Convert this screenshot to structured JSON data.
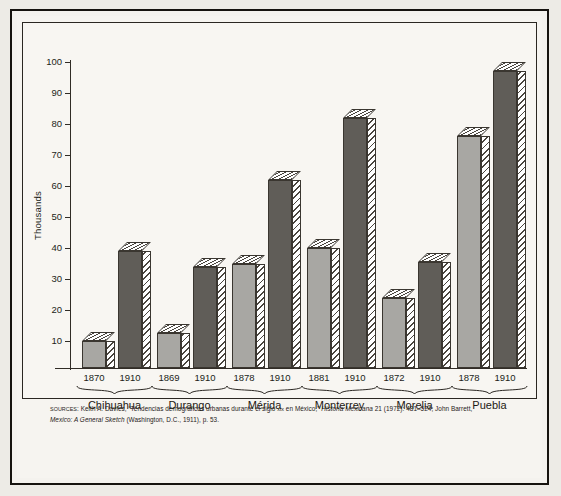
{
  "figure": {
    "y_axis_title": "Thousands",
    "source_note": {
      "prefix": "SOURCES",
      "separator": ": ",
      "part1": "Keith A. Davies, “Tendencias demográficas urbanas durante el siglo ",
      "centuryRoman": "xix",
      "part2": " en México,” ",
      "journal": "Historia Mexicana",
      "part3": " 21 (1972): 481–524; John Barrett, ",
      "book": "Mexico: A General Sketch",
      "part4": " (Washington, D.C., 1911), p. 53."
    },
    "colors": {
      "early_bar": "#a8a7a3",
      "late_bar": "#605d58",
      "outline": "#3a3630",
      "frame": "#2b2722",
      "paper": "#f6f4f0",
      "page_border": "#16130f"
    }
  },
  "chart_data": {
    "type": "bar",
    "title": "",
    "xlabel": "",
    "ylabel": "Thousands",
    "ylim": [
      0,
      100
    ],
    "yticks": [
      10,
      20,
      30,
      40,
      50,
      60,
      70,
      80,
      90,
      100
    ],
    "ytick_labels": [
      "10",
      "20",
      "30",
      "40",
      "50",
      "60",
      "70",
      "80",
      "90",
      "100"
    ],
    "grid": false,
    "legend": "none",
    "units": "thousands of inhabitants",
    "categories": [
      "Chihuahua",
      "Durango",
      "Mérida",
      "Monterrey",
      "Morelia",
      "Puebla"
    ],
    "series": [
      {
        "name": "Earlier census",
        "color": "#a8a7a3",
        "year_labels": [
          "1870",
          "1869",
          "1878",
          "1881",
          "1872",
          "1878"
        ],
        "values": [
          10,
          12.5,
          35,
          40,
          24,
          76
        ]
      },
      {
        "name": "1910",
        "color": "#605d58",
        "year_labels": [
          "1910",
          "1910",
          "1910",
          "1910",
          "1910",
          "1910"
        ],
        "values": [
          39,
          34,
          62,
          82,
          35.5,
          97
        ]
      }
    ],
    "groups": [
      {
        "label": "Chihuahua",
        "bars": [
          {
            "year": "1870",
            "value": 10,
            "series": "Earlier census"
          },
          {
            "year": "1910",
            "value": 39,
            "series": "1910"
          }
        ]
      },
      {
        "label": "Durango",
        "bars": [
          {
            "year": "1869",
            "value": 12.5,
            "series": "Earlier census"
          },
          {
            "year": "1910",
            "value": 34,
            "series": "1910"
          }
        ]
      },
      {
        "label": "Mérida",
        "bars": [
          {
            "year": "1878",
            "value": 35,
            "series": "Earlier census"
          },
          {
            "year": "1910",
            "value": 62,
            "series": "1910"
          }
        ]
      },
      {
        "label": "Monterrey",
        "bars": [
          {
            "year": "1881",
            "value": 40,
            "series": "Earlier census"
          },
          {
            "year": "1910",
            "value": 82,
            "series": "1910"
          }
        ]
      },
      {
        "label": "Morelia",
        "bars": [
          {
            "year": "1872",
            "value": 24,
            "series": "Earlier census"
          },
          {
            "year": "1910",
            "value": 35.5,
            "series": "1910"
          }
        ]
      },
      {
        "label": "Puebla",
        "bars": [
          {
            "year": "1878",
            "value": 76,
            "series": "Earlier census"
          },
          {
            "year": "1910",
            "value": 97,
            "series": "1910"
          }
        ]
      }
    ]
  }
}
